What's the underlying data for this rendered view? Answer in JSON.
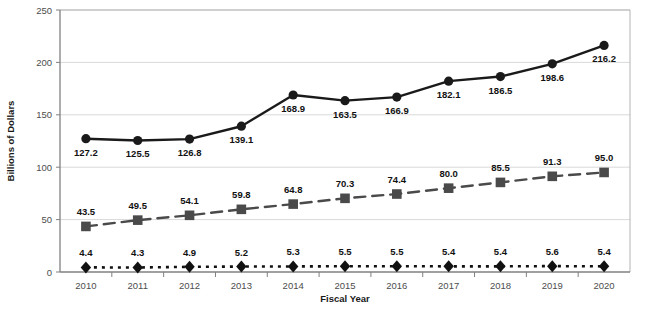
{
  "chart_data": {
    "type": "line",
    "title": "",
    "xlabel": "Fiscal Year",
    "ylabel": "Billions of Dollars",
    "categories": [
      "2010",
      "2011",
      "2012",
      "2013",
      "2014",
      "2015",
      "2016",
      "2017",
      "2018",
      "2019",
      "2020"
    ],
    "ylim": [
      0,
      250
    ],
    "yticks": [
      0,
      50,
      100,
      150,
      200,
      250
    ],
    "ytick_labels": [
      "0",
      "50",
      "100",
      "150",
      "200",
      "250"
    ],
    "grid": true,
    "grid_axis": "y",
    "legend": "none",
    "series": [
      {
        "name": "series-1",
        "marker": "circle",
        "line_style": "solid",
        "color": "#1a1a1a",
        "label_position": "below",
        "values": [
          127.2,
          125.5,
          126.8,
          139.1,
          168.9,
          163.5,
          166.9,
          182.1,
          186.5,
          198.6,
          216.2
        ],
        "labels": [
          "127.2",
          "125.5",
          "126.8",
          "139.1",
          "168.9",
          "163.5",
          "166.9",
          "182.1",
          "186.5",
          "198.6",
          "216.2"
        ]
      },
      {
        "name": "series-2",
        "marker": "square",
        "line_style": "dashed",
        "color": "#4a4a4a",
        "label_position": "above",
        "values": [
          43.5,
          49.5,
          54.1,
          59.8,
          64.8,
          70.3,
          74.4,
          80.0,
          85.5,
          91.3,
          95.0
        ],
        "labels": [
          "43.5",
          "49.5",
          "54.1",
          "59.8",
          "64.8",
          "70.3",
          "74.4",
          "80.0",
          "85.5",
          "91.3",
          "95.0"
        ]
      },
      {
        "name": "series-3",
        "marker": "diamond",
        "line_style": "dotted",
        "color": "#111111",
        "label_position": "above",
        "values": [
          4.4,
          4.3,
          4.9,
          5.2,
          5.3,
          5.5,
          5.5,
          5.4,
          5.4,
          5.6,
          5.4
        ],
        "labels": [
          "4.4",
          "4.3",
          "4.9",
          "5.2",
          "5.3",
          "5.5",
          "5.5",
          "5.4",
          "5.4",
          "5.6",
          "5.4"
        ]
      }
    ]
  },
  "colors": {
    "axis": "#808080",
    "grid": "#d9d9d9",
    "plot_border": "#b3b3b3",
    "background": "#ffffff",
    "series_1": "#1a1a1a",
    "series_2": "#4a4a4a",
    "series_3": "#111111"
  }
}
